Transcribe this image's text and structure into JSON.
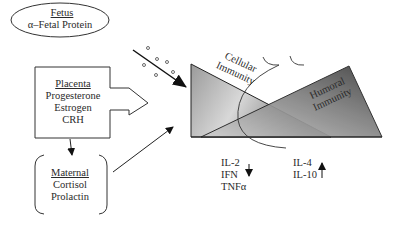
{
  "fetus": {
    "title": "Fetus",
    "item": "α–Fetal Protein"
  },
  "placenta": {
    "title": "Placenta",
    "items": [
      "Progesterone",
      "Estrogen",
      "CRH"
    ]
  },
  "maternal": {
    "title": "Maternal",
    "items": [
      "Cortisol",
      "Prolactin"
    ]
  },
  "immunity": {
    "cellular": [
      "Cellular",
      "Immunity"
    ],
    "humoral": [
      "Humoral",
      "Immunity"
    ]
  },
  "th1_cytokines": {
    "items": [
      "IL-2",
      "IFN",
      "TNFα"
    ],
    "direction": "down"
  },
  "th2_cytokines": {
    "items": [
      "IL-4",
      "IL-10"
    ],
    "direction": "up"
  },
  "colors": {
    "line": "#222222",
    "shade_light": "#e6e6e6",
    "shade_dark": "#5a5a5a"
  }
}
